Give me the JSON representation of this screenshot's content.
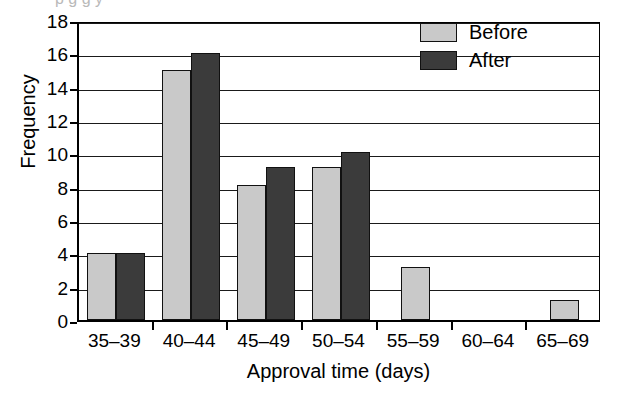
{
  "chart_data": {
    "type": "bar",
    "title": "",
    "xlabel": "Approval time (days)",
    "ylabel": "Frequency",
    "categories": [
      "35–39",
      "40–44",
      "45–49",
      "50–54",
      "55–59",
      "60–64",
      "65–69"
    ],
    "series": [
      {
        "name": "Before",
        "values": [
          4,
          15,
          8.1,
          9.2,
          3.2,
          0,
          1.2
        ]
      },
      {
        "name": "After",
        "values": [
          4,
          16,
          9.2,
          10.1,
          0,
          0,
          0
        ]
      }
    ],
    "ylim": [
      0,
      18
    ],
    "yticks": [
      0,
      2,
      4,
      6,
      8,
      10,
      12,
      14,
      16,
      18
    ],
    "ytick_labels": [
      "0",
      "2",
      "4",
      "6",
      "8",
      "10",
      "12",
      "14",
      "16",
      "18"
    ],
    "grid": "horizontal",
    "legend_position": "top-right",
    "colors": {
      "before": "#c9c9c9",
      "after": "#3b3b3b",
      "axis": "#000000",
      "grid": "#1a1a1a",
      "background": "#ffffff"
    }
  },
  "legend": {
    "entries": [
      {
        "label": "Before",
        "swatch": "before"
      },
      {
        "label": "After",
        "swatch": "after"
      }
    ]
  },
  "cropped_header_text": "p           g   g      y"
}
